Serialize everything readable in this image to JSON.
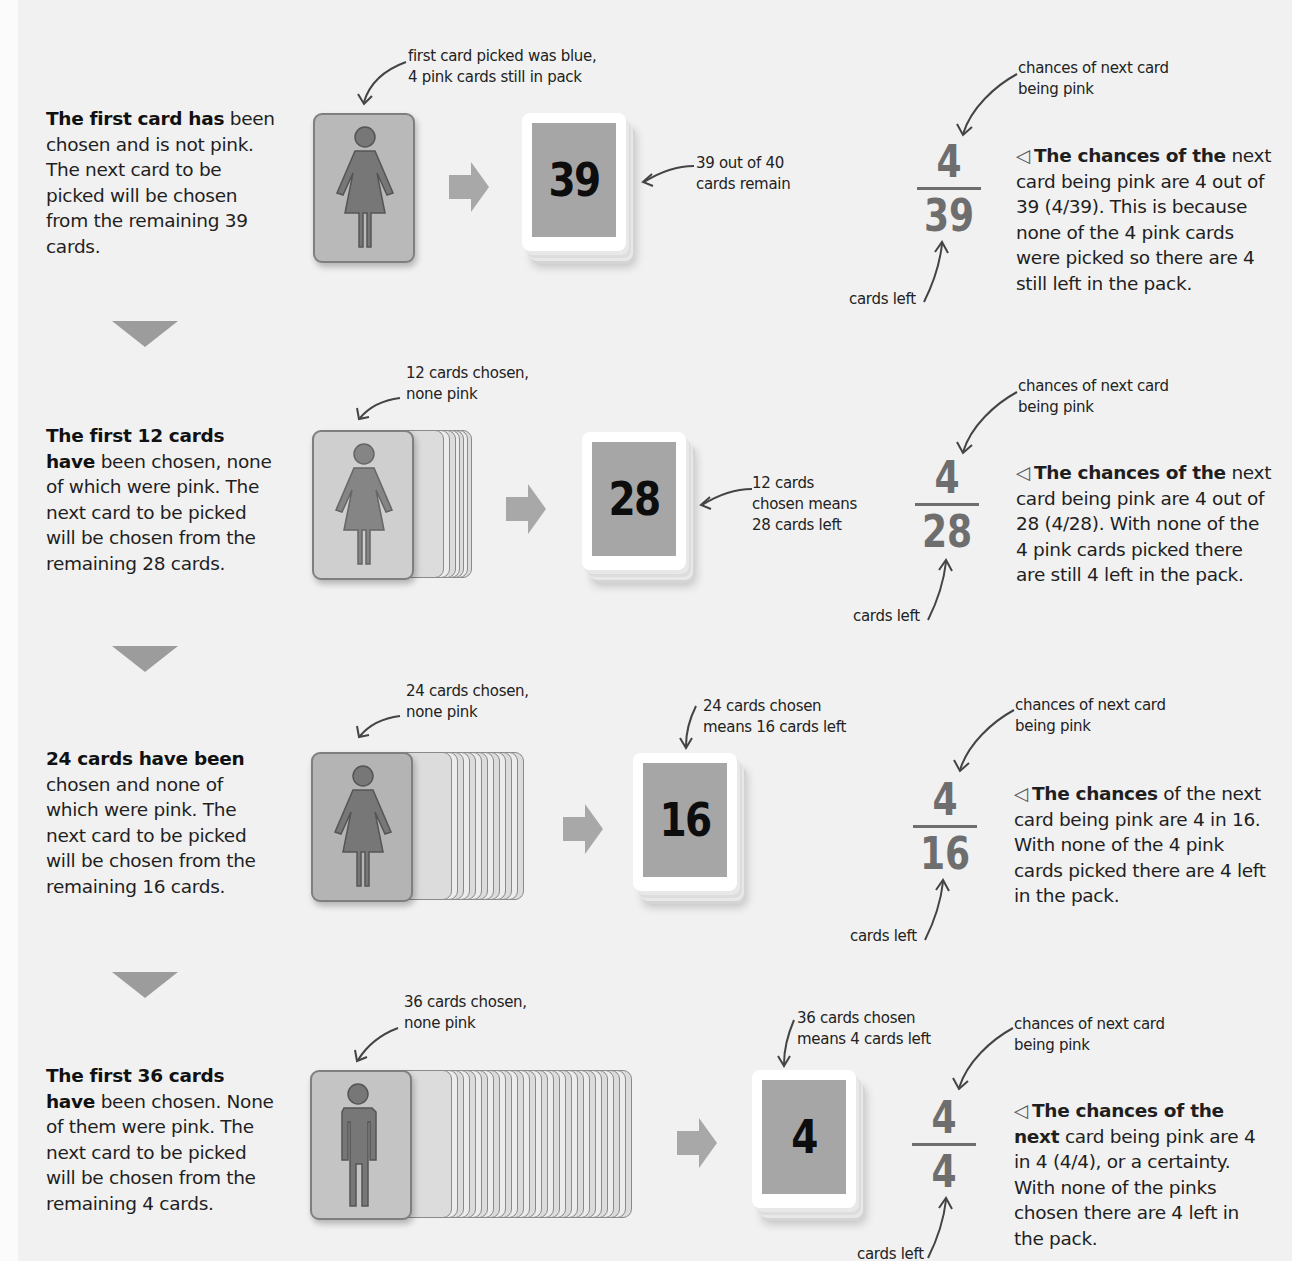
{
  "steps": [
    {
      "desc_bold": "The first card has",
      "desc_rest": " been chosen and is not pink. The next card to be picked will be chosen from the remaining 39 cards.",
      "chosen_note": [
        "first card picked was blue,",
        "4 pink cards still in pack"
      ],
      "figure": "woman",
      "stack_count": 0,
      "pack_number": "39",
      "pack_note": [
        "39 out of 40",
        "cards remain"
      ],
      "chance_note": [
        "chances of next card",
        "being pink"
      ],
      "numerator": "4",
      "denominator": "39",
      "cards_left_label": "cards left",
      "expl_bold": "The chances of the",
      "expl_rest": " next card being pink are 4 out of 39 (4/39). This is because none of the 4 pink cards were picked so there are 4 still left in the pack."
    },
    {
      "desc_bold": "The first 12 cards have",
      "desc_rest": " been chosen, none of which were pink. The next card to be picked will be chosen from the remaining 28 cards.",
      "chosen_note": [
        "12 cards chosen,",
        "none pink"
      ],
      "figure": "woman",
      "stack_count": 11,
      "pack_number": "28",
      "pack_note": [
        "12 cards",
        "chosen means",
        "28 cards left"
      ],
      "chance_note": [
        "chances of next card",
        "being pink"
      ],
      "numerator": "4",
      "denominator": "28",
      "cards_left_label": "cards left",
      "expl_bold": "The chances of the",
      "expl_rest": " next card being pink are 4 out of 28 (4/28). With none of the 4 pink cards picked there are still 4 left in the pack."
    },
    {
      "desc_bold": "24 cards have been",
      "desc_rest": " chosen and none of which were pink. The next card to be picked will be chosen from the remaining 16 cards.",
      "chosen_note": [
        "24 cards chosen,",
        "none pink"
      ],
      "figure": "woman",
      "stack_count": 23,
      "pack_number": "16",
      "pack_note": [
        "24 cards chosen",
        "means 16 cards left"
      ],
      "chance_note": [
        "chances of next card",
        "being pink"
      ],
      "numerator": "4",
      "denominator": "16",
      "cards_left_label": "cards left",
      "expl_bold": "The chances",
      "expl_rest": " of the next card being pink are 4 in 16. With none of the 4 pink cards picked there are 4 left in the pack."
    },
    {
      "desc_bold": "The first 36 cards have",
      "desc_rest": " been chosen. None of them were pink. The next card to be picked will be chosen from the remaining 4 cards.",
      "chosen_note": [
        "36 cards chosen,",
        "none pink"
      ],
      "figure": "man",
      "stack_count": 35,
      "pack_number": "4",
      "pack_note": [
        "36 cards chosen",
        "means 4 cards left"
      ],
      "chance_note": [
        "chances of next card",
        "being pink"
      ],
      "numerator": "4",
      "denominator": "4",
      "cards_left_label": "cards left",
      "expl_bold": "The chances of the next",
      "expl_rest": " card being pink are 4 in 4 (4/4), or a certainty. With none of the pinks chosen there are 4 left in the pack."
    }
  ],
  "icons": {
    "flow_arrow": "right-arrow-icon",
    "step_divider": "down-triangle-icon",
    "explanation_marker": "◁"
  },
  "colors": {
    "background": "#f1f1f1",
    "card_gray": "#b9b9b9",
    "pack_face": "#a6a6a6",
    "fraction": "#6e6e6e"
  }
}
